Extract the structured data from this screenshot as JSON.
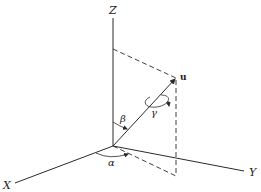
{
  "diagram": {
    "colors": {
      "background": "#ffffff",
      "ink": "#2a2a2a"
    },
    "origin": [
      113,
      146
    ],
    "axes": [
      {
        "name": "Z",
        "label": "Z",
        "from": [
          113,
          146
        ],
        "to": [
          113,
          18
        ],
        "label_pos": [
          109,
          13
        ]
      },
      {
        "name": "X",
        "label": "X",
        "from": [
          113,
          146
        ],
        "to": [
          15,
          183
        ],
        "label_pos": [
          3,
          189
        ]
      },
      {
        "name": "Y",
        "label": "Y",
        "from": [
          113,
          146
        ],
        "to": [
          244,
          171
        ],
        "label_pos": [
          249,
          176
        ]
      }
    ],
    "vector": {
      "label": "u",
      "from": [
        113,
        146
      ],
      "to": [
        176,
        78
      ],
      "label_pos": [
        180,
        79
      ]
    },
    "projections": [
      {
        "name": "z-projection",
        "from": [
          113,
          49
        ],
        "to": [
          176,
          78
        ],
        "style": "dashed"
      },
      {
        "name": "vertical-drop",
        "from": [
          176,
          78
        ],
        "to": [
          176,
          176
        ],
        "style": "dashed"
      },
      {
        "name": "xy-projection",
        "from": [
          113,
          146
        ],
        "to": [
          176,
          176
        ],
        "style": "dashed"
      }
    ],
    "angles": [
      {
        "symbol": "β",
        "name": "beta",
        "meaning": "angle between Z axis and u",
        "label_pos": [
          120,
          121
        ]
      },
      {
        "symbol": "α",
        "name": "alpha",
        "meaning": "azimuth in XY plane from X axis",
        "label_pos": [
          108,
          165
        ]
      },
      {
        "symbol": "γ",
        "name": "gamma",
        "meaning": "rotation about u",
        "label_pos": [
          151,
          115
        ]
      }
    ]
  }
}
